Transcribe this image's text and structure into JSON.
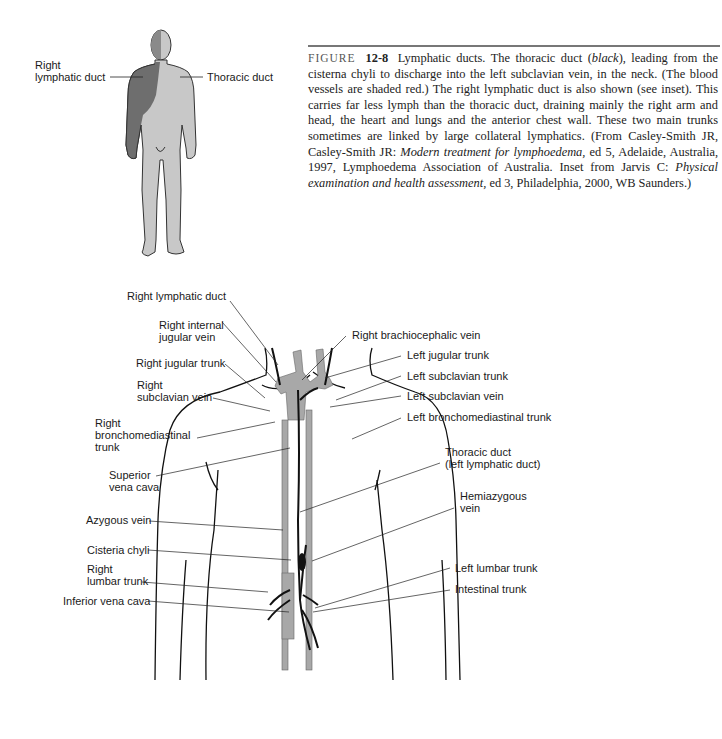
{
  "inset": {
    "labels": {
      "right_lymphatic_duct": [
        "Right",
        "lymphatic duct"
      ],
      "thoracic_duct": "Thoracic duct"
    },
    "colors": {
      "body": "#c8c8c8",
      "right_region": "#6e6e6e",
      "outline": "#333333"
    }
  },
  "caption": {
    "figure_word": "FIGURE",
    "figure_number": "12-8",
    "text_1": "Lymphatic ducts. The thoracic duct (",
    "italic_1": "black",
    "text_2": "), leading from the cisterna chyli to discharge into the left subclavian vein, in the neck. (The blood vessels are shaded red.) The right lymphatic duct is also shown (see inset). This carries far less lymph than the thoracic duct, draining mainly the right arm and head, the heart and lungs and the anterior chest wall. These two main trunks sometimes are linked by large collateral lymphatics. (From Casley-Smith JR, Casley-Smith JR: ",
    "italic_2": "Modern treatment for lymphoedema,",
    "text_3": " ed 5, Adelaide, Australia, 1997, Lymphoedema Association of Australia. Inset from Jarvis C: ",
    "italic_3": "Physical examination and health assessment,",
    "text_4": " ed 3, Philadelphia, 2000, WB Saunders.)"
  },
  "diagram": {
    "left_labels": {
      "right_lymphatic_duct": "Right lymphatic duct",
      "right_internal_jugular_vein": [
        "Right internal",
        "jugular vein"
      ],
      "right_jugular_trunk": "Right jugular trunk",
      "right_subclavian_vein": [
        "Right",
        "subclavian vein"
      ],
      "right_bronchomediastinal_trunk": [
        "Right",
        "bronchomediastinal",
        "trunk"
      ],
      "superior_vena_cava": [
        "Superior",
        "vena cava"
      ],
      "azygous_vein": "Azygous vein",
      "cisteria_chyli": "Cisteria chyli",
      "right_lumbar_trunk": [
        "Right",
        "lumbar trunk"
      ],
      "inferior_vena_cava": "Inferior vena cava"
    },
    "right_labels": {
      "right_brachiocephalic_vein": "Right brachiocephalic vein",
      "left_jugular_trunk": "Left jugular trunk",
      "left_subclavian_trunk": "Left subclavian trunk",
      "left_subclavian_vein": "Left subclavian vein",
      "left_bronchomediastinal_trunk": "Left bronchomediastinal trunk",
      "thoracic_duct": [
        "Thoracic duct",
        "(left lymphatic duct)"
      ],
      "hemiazygous_vein": [
        "Hemiazygous",
        "vein"
      ],
      "left_lumbar_trunk": "Left lumbar trunk",
      "intestinal_trunk": "Intestinal trunk"
    },
    "colors": {
      "vessel": "#a8a8a8",
      "duct": "#111111",
      "outline": "#111111"
    }
  }
}
